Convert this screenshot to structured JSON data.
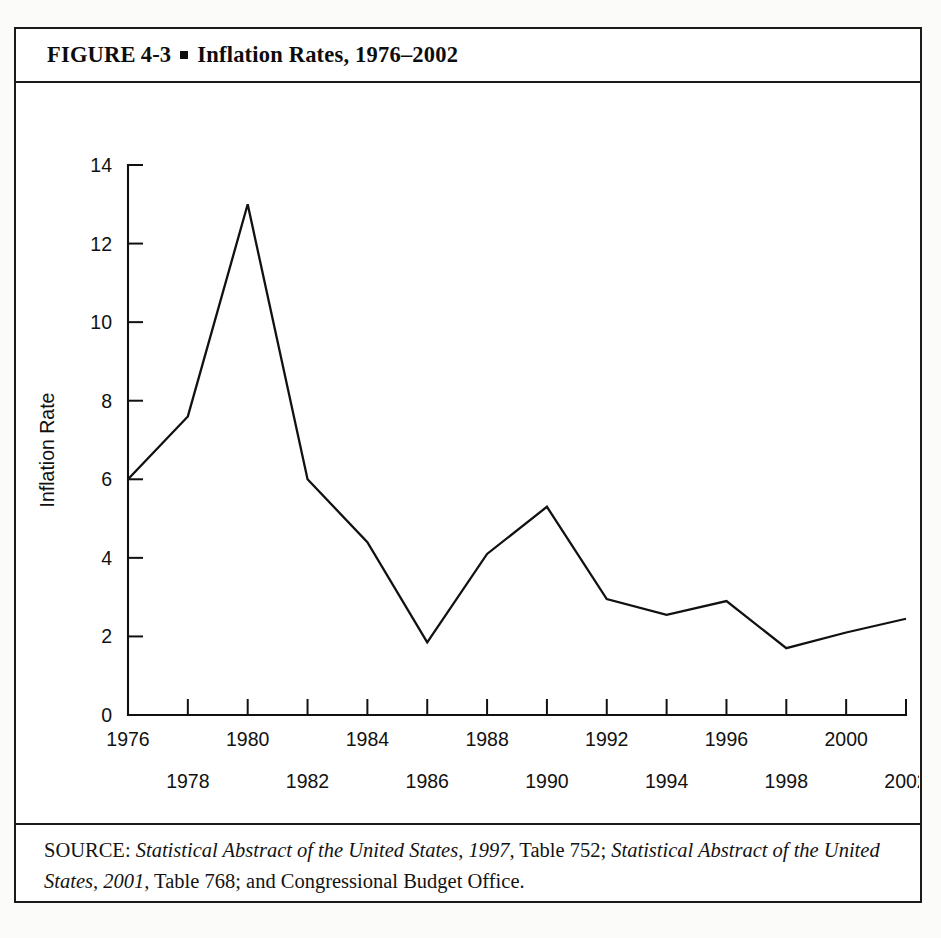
{
  "figure": {
    "label": "FIGURE",
    "number": "4-3",
    "bullet": "▪",
    "title": "Inflation Rates, 1976–2002",
    "full_title": "FIGURE  4-3 ▪ Inflation Rates, 1976–2002"
  },
  "source": {
    "prefix": "SOURCE:",
    "ref1_italic": "Statistical Abstract of the United States, 1997,",
    "ref1_rest": " Table 752; ",
    "ref2_italic": "Statistical Abstract of the United States, 2001,",
    "ref2_rest": " Table 768; and Congressional Budget Office.",
    "full_text": "SOURCE: Statistical Abstract of the United States, 1997, Table 752; Statistical Abstract of the United States, 2001, Table 768; and Congressional Budget Office."
  },
  "colors": {
    "ink": "#111111",
    "frame": "#1a1a1a",
    "page": "#ffffff",
    "line": "#111111"
  },
  "chart_data": {
    "type": "line",
    "title": "Inflation Rates, 1976–2002",
    "xlabel": "Year",
    "ylabel": "Inflation Rate",
    "xlim": [
      1976,
      2002
    ],
    "ylim": [
      0,
      14
    ],
    "grid": false,
    "legend": "none",
    "y_ticks": [
      0,
      2,
      4,
      6,
      8,
      10,
      12,
      14
    ],
    "y_tick_labels": [
      "0",
      "2",
      "4",
      "6",
      "8",
      "10",
      "12",
      "14"
    ],
    "x_ticks": [
      1976,
      1978,
      1980,
      1982,
      1984,
      1986,
      1988,
      1990,
      1992,
      1994,
      1996,
      1998,
      2000,
      2002
    ],
    "x_tick_labels_upper": [
      "1976",
      "",
      "1980",
      "",
      "1984",
      "",
      "1988",
      "",
      "1992",
      "",
      "1996",
      "",
      "2000",
      ""
    ],
    "x_tick_labels_lower": [
      "",
      "1978",
      "",
      "1982",
      "",
      "1986",
      "",
      "1990",
      "",
      "1994",
      "",
      "1998",
      "",
      "2002"
    ],
    "x": [
      1976,
      1978,
      1980,
      1982,
      1984,
      1986,
      1988,
      1990,
      1992,
      1994,
      1996,
      1998,
      2000,
      2002
    ],
    "values": [
      6.0,
      7.6,
      13.0,
      6.0,
      4.4,
      1.85,
      4.1,
      5.3,
      2.95,
      2.55,
      2.9,
      1.7,
      2.1,
      2.45
    ],
    "series": [
      {
        "name": "Inflation Rate",
        "values": [
          6.0,
          7.6,
          13.0,
          6.0,
          4.4,
          1.85,
          4.1,
          5.3,
          2.95,
          2.55,
          2.9,
          1.7,
          2.1,
          2.45
        ]
      }
    ]
  }
}
